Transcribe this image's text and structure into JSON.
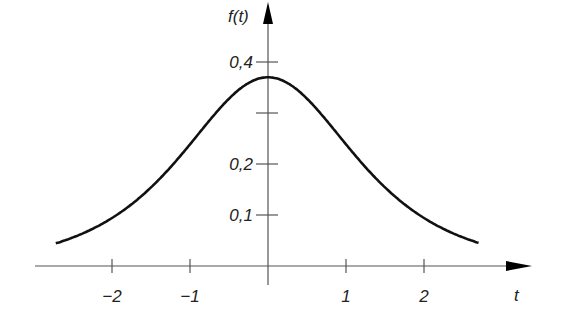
{
  "chart_data": {
    "type": "line",
    "title": "",
    "xlabel": "t",
    "ylabel": "f(t)",
    "x_ticks": [
      "−2",
      "−1",
      "1",
      "2"
    ],
    "y_ticks": [
      "0,1",
      "0,2",
      "0,4"
    ],
    "xlim": [
      -3.1,
      3.4
    ],
    "ylim": [
      0,
      0.45
    ],
    "grid": false,
    "series": [
      {
        "name": "f(t)",
        "x": [
          -2.7,
          -2.5,
          -2,
          -1.5,
          -1,
          -0.5,
          0,
          0.5,
          1,
          1.5,
          2,
          2.5,
          2.7
        ],
        "y": [
          0.033,
          0.04,
          0.065,
          0.11,
          0.18,
          0.29,
          0.37,
          0.29,
          0.18,
          0.11,
          0.065,
          0.04,
          0.033
        ]
      }
    ]
  }
}
